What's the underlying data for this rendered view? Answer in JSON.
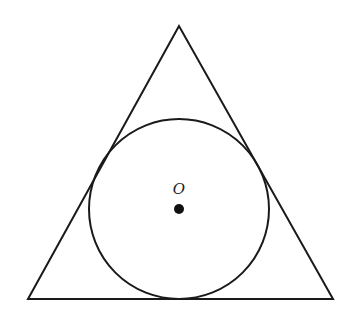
{
  "diagram": {
    "triangle": {
      "vertices": [
        [
          179,
          26
        ],
        [
          28,
          299
        ],
        [
          333,
          299
        ]
      ],
      "stroke": "#1a1a1a"
    },
    "circle": {
      "center": [
        179,
        209
      ],
      "radius": 90,
      "stroke": "#1a1a1a"
    },
    "center_point": {
      "label": "O",
      "position": [
        179,
        209
      ],
      "label_position": [
        179,
        194
      ]
    }
  }
}
